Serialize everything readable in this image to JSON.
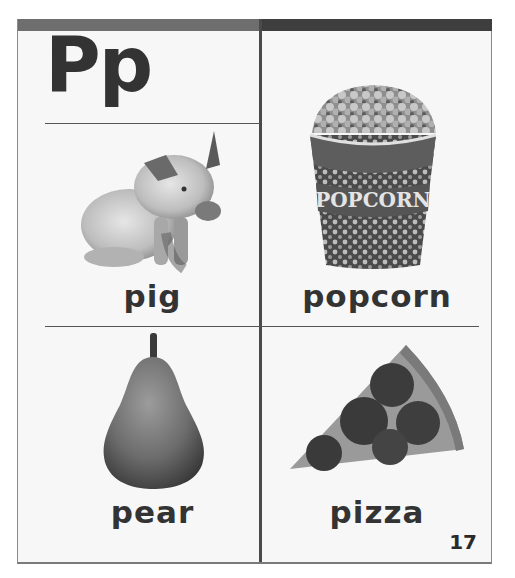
{
  "page": {
    "heading": "Pp",
    "page_number": "17",
    "colors": {
      "topbar_left": "#6e6e6e",
      "topbar_right": "#3e3e3e",
      "text": "#333333",
      "background": "#f7f7f7"
    }
  },
  "cards": [
    {
      "word": "pig",
      "icon": "pig-photo"
    },
    {
      "word": "popcorn",
      "icon": "popcorn-bucket-photo",
      "bucket_text": "POPCORN"
    },
    {
      "word": "pear",
      "icon": "pear-photo"
    },
    {
      "word": "pizza",
      "icon": "pizza-slice-photo"
    }
  ]
}
